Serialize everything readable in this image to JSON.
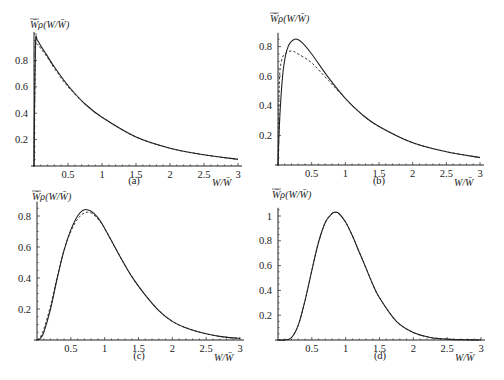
{
  "chart_data": [
    {
      "panel": "(a)",
      "type": "line",
      "ylabel": "W̄_ρ(W/W̄)",
      "xlabel": "W/W̄",
      "xticks": [
        "0.5",
        "1",
        "1.5",
        "2",
        "2.5",
        "3"
      ],
      "yticks": [
        "0.2",
        "0.4",
        "0.6",
        "0.8"
      ],
      "xlim": [
        0,
        3
      ],
      "ylim": [
        0,
        1.0
      ],
      "series": [
        {
          "name": "solid",
          "style": "solid",
          "x": [
            0.0,
            0.02,
            0.05,
            0.1,
            0.2,
            0.3,
            0.5,
            0.75,
            1.0,
            1.5,
            2.0,
            2.5,
            3.0
          ],
          "y": [
            0.0,
            0.9,
            0.95,
            0.91,
            0.83,
            0.75,
            0.61,
            0.47,
            0.37,
            0.22,
            0.135,
            0.085,
            0.05
          ]
        },
        {
          "name": "dashed",
          "style": "dashed",
          "x": [
            0.0,
            0.02,
            0.05,
            0.1,
            0.2,
            0.3,
            0.5,
            0.75,
            1.0,
            1.5,
            2.0,
            2.5,
            3.0
          ],
          "y": [
            0.0,
            0.85,
            0.92,
            0.89,
            0.82,
            0.74,
            0.6,
            0.47,
            0.37,
            0.22,
            0.135,
            0.085,
            0.05
          ]
        }
      ]
    },
    {
      "panel": "(b)",
      "type": "line",
      "ylabel": "W̄_ρ(W/W̄)",
      "xlabel": "W/W̄",
      "xticks": [
        "0.5",
        "1",
        "1.5",
        "2",
        "2.5",
        "3"
      ],
      "yticks": [
        "0.2",
        "0.4",
        "0.6",
        "0.8"
      ],
      "xlim": [
        0,
        3
      ],
      "ylim": [
        0,
        0.88
      ],
      "series": [
        {
          "name": "solid",
          "style": "solid",
          "x": [
            0.0,
            0.03,
            0.08,
            0.15,
            0.25,
            0.35,
            0.5,
            0.75,
            1.0,
            1.25,
            1.5,
            2.0,
            2.5,
            3.0
          ],
          "y": [
            0.0,
            0.35,
            0.65,
            0.8,
            0.85,
            0.83,
            0.75,
            0.59,
            0.45,
            0.34,
            0.26,
            0.15,
            0.09,
            0.05
          ]
        },
        {
          "name": "dashed",
          "style": "dashed",
          "x": [
            0.0,
            0.02,
            0.05,
            0.1,
            0.2,
            0.3,
            0.5,
            0.75,
            1.0,
            1.25,
            1.5,
            2.0,
            2.5,
            3.0
          ],
          "y": [
            0.0,
            0.55,
            0.7,
            0.75,
            0.77,
            0.75,
            0.69,
            0.57,
            0.45,
            0.34,
            0.26,
            0.15,
            0.09,
            0.05
          ]
        }
      ]
    },
    {
      "panel": "(c)",
      "type": "line",
      "ylabel": "W̄_ρ(W/W̄)",
      "xlabel": "W/W̄",
      "xticks": [
        "0.5",
        "1",
        "1.5",
        "2",
        "2.5",
        "3"
      ],
      "yticks": [
        "0.2",
        "0.4",
        "0.6",
        "0.8"
      ],
      "xlim": [
        0,
        3
      ],
      "ylim": [
        0,
        0.88
      ],
      "series": [
        {
          "name": "solid",
          "style": "solid",
          "x": [
            0.0,
            0.05,
            0.1,
            0.2,
            0.3,
            0.4,
            0.5,
            0.6,
            0.7,
            0.8,
            0.9,
            1.0,
            1.2,
            1.4,
            1.6,
            1.8,
            2.0,
            2.25,
            2.5,
            2.75,
            3.0
          ],
          "y": [
            0.0,
            0.01,
            0.05,
            0.2,
            0.4,
            0.58,
            0.71,
            0.8,
            0.84,
            0.83,
            0.79,
            0.72,
            0.56,
            0.41,
            0.29,
            0.19,
            0.12,
            0.07,
            0.04,
            0.02,
            0.01
          ]
        },
        {
          "name": "dashed",
          "style": "dashed",
          "x": [
            0.0,
            0.05,
            0.1,
            0.2,
            0.3,
            0.4,
            0.5,
            0.6,
            0.7,
            0.8,
            0.9,
            1.0,
            1.2,
            1.4,
            1.6,
            1.8,
            2.0,
            2.25,
            2.5,
            2.75,
            3.0
          ],
          "y": [
            0.0,
            0.02,
            0.07,
            0.22,
            0.41,
            0.58,
            0.7,
            0.78,
            0.82,
            0.82,
            0.78,
            0.72,
            0.56,
            0.41,
            0.29,
            0.19,
            0.12,
            0.07,
            0.04,
            0.02,
            0.01
          ]
        }
      ]
    },
    {
      "panel": "(d)",
      "type": "line",
      "ylabel": "W̄_ρ(W/W̄)",
      "xlabel": "W/W̄",
      "xticks": [
        "0.5",
        "1",
        "1.5",
        "2",
        "2.5",
        "3"
      ],
      "yticks": [
        "0.2",
        "0.4",
        "0.6",
        "0.8",
        "1"
      ],
      "xlim": [
        0,
        3
      ],
      "ylim": [
        0,
        1.05
      ],
      "series": [
        {
          "name": "solid",
          "style": "solid",
          "x": [
            0.0,
            0.1,
            0.2,
            0.3,
            0.4,
            0.5,
            0.6,
            0.7,
            0.8,
            0.85,
            0.9,
            1.0,
            1.1,
            1.2,
            1.3,
            1.4,
            1.5,
            1.75,
            2.0,
            2.25,
            2.5,
            2.75,
            3.0
          ],
          "y": [
            0.0,
            0.0,
            0.02,
            0.12,
            0.32,
            0.56,
            0.79,
            0.95,
            1.02,
            1.03,
            1.02,
            0.95,
            0.84,
            0.71,
            0.58,
            0.45,
            0.34,
            0.15,
            0.06,
            0.02,
            0.007,
            0.002,
            0.0
          ]
        },
        {
          "name": "dashed",
          "style": "dashed",
          "x": [
            0.0,
            0.1,
            0.2,
            0.3,
            0.4,
            0.5,
            0.6,
            0.7,
            0.8,
            0.85,
            0.9,
            1.0,
            1.1,
            1.2,
            1.3,
            1.4,
            1.5,
            1.75,
            2.0,
            2.25,
            2.5,
            2.75,
            3.0
          ],
          "y": [
            0.0,
            0.0,
            0.02,
            0.12,
            0.32,
            0.56,
            0.79,
            0.95,
            1.02,
            1.03,
            1.02,
            0.95,
            0.84,
            0.71,
            0.58,
            0.45,
            0.34,
            0.15,
            0.06,
            0.02,
            0.007,
            0.002,
            0.0
          ]
        }
      ]
    }
  ],
  "panels": [
    {
      "caption": "(a)",
      "ylabel": "W̄ρ(W/W̄)",
      "xlabel": "W/W̄"
    },
    {
      "caption": "(b)",
      "ylabel": "W̄ρ(W/W̄)",
      "xlabel": "W/W̄"
    },
    {
      "caption": "(c)",
      "ylabel": "W̄ρ(W/W̄)",
      "xlabel": "W/W̄"
    },
    {
      "caption": "(d)",
      "ylabel": "W̄ρ(W/W̄)",
      "xlabel": "W/W̄"
    }
  ]
}
